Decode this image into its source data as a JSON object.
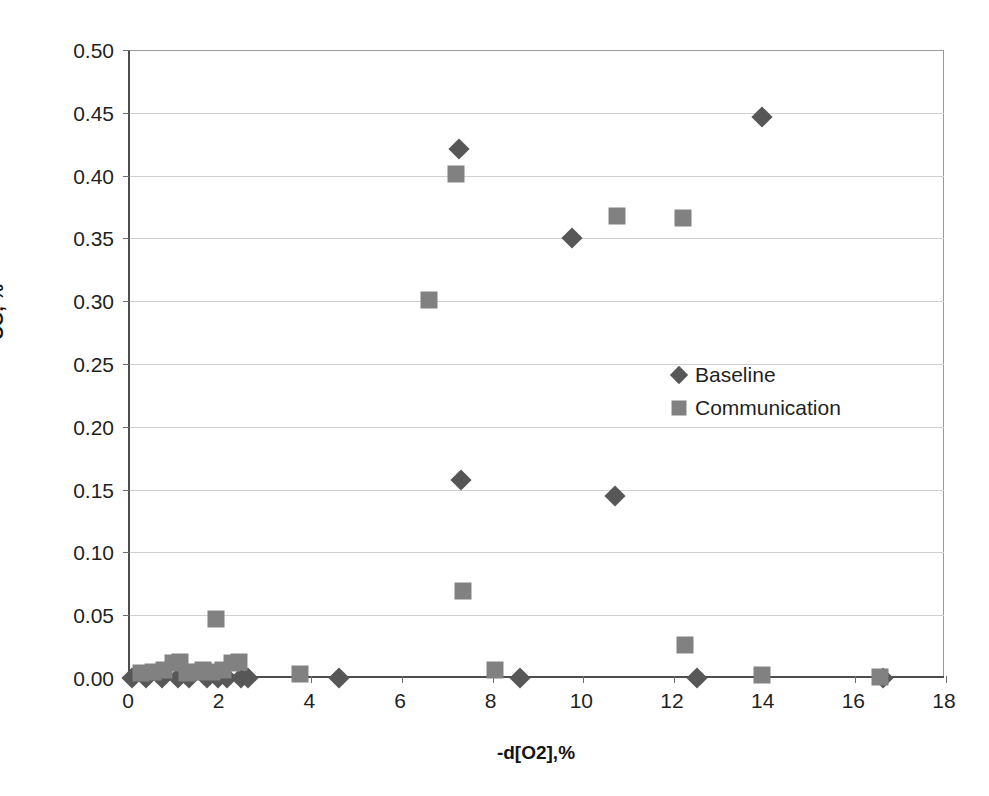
{
  "chart_data": {
    "type": "scatter",
    "title": "",
    "xlabel": "-d[O2],%",
    "ylabel": "CO, %",
    "xlim": [
      0,
      18
    ],
    "ylim": [
      0,
      0.5
    ],
    "xticks": [
      0,
      2,
      4,
      6,
      8,
      10,
      12,
      14,
      16,
      18
    ],
    "xtick_labels": [
      "0",
      "2",
      "4",
      "6",
      "8",
      "10",
      "12",
      "14",
      "16",
      "18"
    ],
    "yticks": [
      0.0,
      0.05,
      0.1,
      0.15,
      0.2,
      0.25,
      0.3,
      0.35,
      0.4,
      0.45,
      0.5
    ],
    "ytick_labels": [
      "0.00",
      "0.05",
      "0.10",
      "0.15",
      "0.20",
      "0.25",
      "0.30",
      "0.35",
      "0.40",
      "0.45",
      "0.50"
    ],
    "grid": "horizontal",
    "legend_position": "center-right",
    "series": [
      {
        "name": "Baseline",
        "marker": "diamond",
        "color": "#575757",
        "points": [
          [
            0.05,
            0.0
          ],
          [
            0.35,
            0.0
          ],
          [
            0.7,
            0.0
          ],
          [
            1.05,
            0.0
          ],
          [
            1.3,
            0.0
          ],
          [
            1.7,
            0.0
          ],
          [
            1.95,
            0.0
          ],
          [
            2.15,
            0.0
          ],
          [
            2.45,
            0.0
          ],
          [
            2.6,
            0.0
          ],
          [
            4.6,
            0.0
          ],
          [
            7.25,
            0.421
          ],
          [
            7.3,
            0.158
          ],
          [
            8.6,
            0.0
          ],
          [
            9.75,
            0.35
          ],
          [
            10.7,
            0.145
          ],
          [
            12.5,
            0.0
          ],
          [
            13.95,
            0.447
          ],
          [
            16.6,
            0.0
          ]
        ]
      },
      {
        "name": "Communication",
        "marker": "square",
        "color": "#818181",
        "points": [
          [
            0.25,
            0.004
          ],
          [
            0.5,
            0.005
          ],
          [
            0.75,
            0.006
          ],
          [
            0.95,
            0.012
          ],
          [
            1.1,
            0.013
          ],
          [
            1.25,
            0.004
          ],
          [
            1.45,
            0.005
          ],
          [
            1.6,
            0.006
          ],
          [
            1.8,
            0.005
          ],
          [
            1.9,
            0.047
          ],
          [
            2.05,
            0.006
          ],
          [
            2.25,
            0.012
          ],
          [
            2.4,
            0.013
          ],
          [
            3.75,
            0.003
          ],
          [
            6.6,
            0.301
          ],
          [
            7.2,
            0.401
          ],
          [
            7.35,
            0.069
          ],
          [
            8.05,
            0.006
          ],
          [
            10.75,
            0.368
          ],
          [
            12.2,
            0.366
          ],
          [
            12.25,
            0.026
          ],
          [
            13.95,
            0.002
          ],
          [
            16.55,
            0.001
          ]
        ]
      }
    ]
  },
  "legend": {
    "items": [
      {
        "label": "Baseline",
        "marker": "diamond"
      },
      {
        "label": "Communication",
        "marker": "square"
      }
    ]
  },
  "colors": {
    "baseline": "#575757",
    "communication": "#818181",
    "gridline": "#d0d0d0",
    "axis": "#4d4d4d",
    "text": "#1f1f1f",
    "background": "#ffffff"
  }
}
